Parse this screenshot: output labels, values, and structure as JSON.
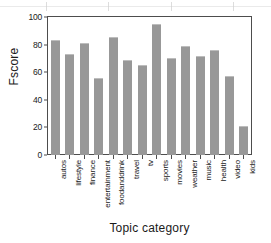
{
  "chart_data": {
    "type": "bar",
    "title": "",
    "xlabel": "Topic category",
    "ylabel": "Fscore",
    "categories": [
      "autos",
      "lifestyle",
      "finance",
      "entertainment",
      "foodanddrink",
      "travel",
      "tv",
      "sports",
      "movies",
      "weather",
      "music",
      "health",
      "video",
      "kids"
    ],
    "values": [
      83,
      73,
      81,
      56,
      85.5,
      69,
      65,
      95,
      70,
      79,
      72,
      76,
      57,
      21
    ],
    "ylim": [
      0,
      100
    ],
    "yticks": [
      0,
      20,
      40,
      60,
      80,
      100
    ],
    "ytick_labels": [
      "0",
      "20",
      "40",
      "60",
      "80",
      "100"
    ],
    "grid": false,
    "legend": null,
    "bar_color": "#989898",
    "axis_color": "#4d4d4d",
    "background": "#ffffff"
  },
  "axis": {
    "y_title": "Fscore",
    "x_title": "Topic category"
  }
}
